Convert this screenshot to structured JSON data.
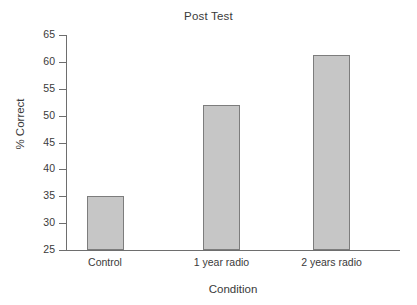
{
  "chart_data": {
    "type": "bar",
    "title": "Post Test",
    "xlabel": "Condition",
    "ylabel": "% Correct",
    "categories": [
      "Control",
      "1 year radio",
      "2 years radio"
    ],
    "values": [
      35,
      52,
      61.3
    ],
    "ylim": [
      25,
      65
    ],
    "yticks": [
      25,
      30,
      35,
      40,
      45,
      50,
      55,
      60,
      65
    ],
    "ytick_labels": [
      "25",
      "30",
      "35",
      "40",
      "45",
      "50",
      "55",
      "60",
      "65"
    ],
    "grid": false,
    "legend": null,
    "bar_color": "#c6c6c6",
    "bar_edge_color": "#7d7d7d",
    "axis_color": "#6e6e6e",
    "text_color": "#3a3a3a",
    "background": "#ffffff"
  }
}
